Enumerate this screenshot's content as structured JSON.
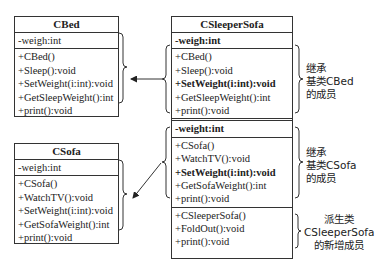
{
  "classes": {
    "cbed": {
      "name": "CBed",
      "attributes": [
        "-weigh:int"
      ],
      "methods": [
        "+CBed()",
        "+Sleep():void",
        "+SetWeight(i:int):void",
        "+GetSleepWeight():int",
        "+print():void"
      ]
    },
    "csofa": {
      "name": "CSofa",
      "attributes": [
        "-weigh:int"
      ],
      "methods": [
        "+CSofa()",
        "+WatchTV():void",
        "+SetWeight(i:int):void",
        "+GetSofaWeight():int",
        "+print():void"
      ]
    },
    "csleepersofa": {
      "name": "CSleeperSofa",
      "inherited_cbed": {
        "attribute": "-weigh:int",
        "methods": [
          "+CBed()",
          "+Sleep():void",
          "+SetWeight(i:int):void",
          "+GetSleepWeight():int",
          "+print():void"
        ]
      },
      "inherited_csofa": {
        "attribute": "-weight:int",
        "methods": [
          "+CSofa()",
          "+WatchTV():void",
          "+SetWeight(i:int):void",
          "+GetSofaWeight():int",
          "+print():void"
        ]
      },
      "own_methods": [
        "+CSleeperSofa()",
        "+FoldOut():void",
        "+print():void"
      ]
    }
  },
  "annotations": {
    "cbed_members": [
      "继承",
      "基类CBed",
      "的成员"
    ],
    "csofa_members": [
      "继承",
      "基类CSofa",
      "的成员"
    ],
    "new_members": [
      "派生类",
      "CSleeperSofa",
      "的新增成员"
    ]
  }
}
